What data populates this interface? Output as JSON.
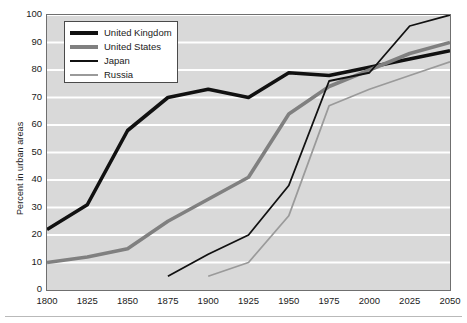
{
  "chart_data": {
    "type": "line",
    "title": "",
    "xlabel": "",
    "ylabel": "Percent in urban areas",
    "xlim": [
      1800,
      2050
    ],
    "ylim": [
      0,
      100
    ],
    "grid": true,
    "legend_position": "top-left",
    "x": [
      1800,
      1825,
      1850,
      1875,
      1900,
      1925,
      1950,
      1975,
      2000,
      2025,
      2050
    ],
    "xticks": [
      "1800",
      "1825",
      "1850",
      "1875",
      "1900",
      "1925",
      "1950",
      "1975",
      "2000",
      "2025",
      "2050"
    ],
    "yticks": [
      "0",
      "10",
      "20",
      "30",
      "40",
      "50",
      "60",
      "70",
      "80",
      "90",
      "100"
    ],
    "series": [
      {
        "name": "United Kingdom",
        "color": "#111111",
        "width": "thick",
        "x": [
          1800,
          1825,
          1850,
          1875,
          1900,
          1925,
          1950,
          1975,
          2000,
          2025,
          2050
        ],
        "values": [
          22,
          31,
          58,
          70,
          73,
          70,
          79,
          78,
          81,
          84,
          87
        ]
      },
      {
        "name": "United States",
        "color": "#808080",
        "width": "thick",
        "x": [
          1800,
          1825,
          1850,
          1875,
          1900,
          1925,
          1950,
          1975,
          2000,
          2025,
          2050
        ],
        "values": [
          10,
          12,
          15,
          25,
          33,
          41,
          64,
          74,
          80,
          86,
          90
        ]
      },
      {
        "name": "Japan",
        "color": "#111111",
        "width": "thin",
        "x": [
          1875,
          1900,
          1925,
          1950,
          1975,
          2000,
          2025,
          2050
        ],
        "values": [
          5,
          13,
          20,
          38,
          76,
          79,
          96,
          100
        ]
      },
      {
        "name": "Russia",
        "color": "#9a9a9a",
        "width": "thin",
        "x": [
          1900,
          1925,
          1950,
          1975,
          2000,
          2025,
          2050
        ],
        "values": [
          5,
          10,
          27,
          67,
          73,
          78,
          83
        ]
      }
    ]
  },
  "colors": {
    "plot_background": "#d9d9d9",
    "gridline": "#ffffff",
    "axis": "#6f6f6f",
    "text": "#1a1a1a"
  }
}
